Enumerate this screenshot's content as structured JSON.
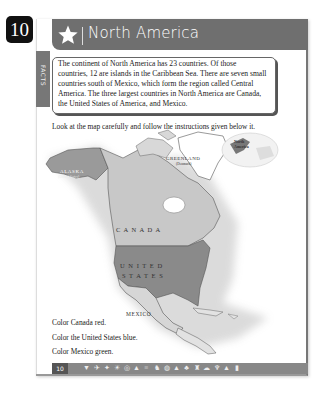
{
  "page_number_badge": "10",
  "header": {
    "title": "North America",
    "icon": "star-icon"
  },
  "facts": {
    "tab_label": "FACTS",
    "text": "The continent of North America has 23 countries. Of those countries, 12 are islands in the Caribbean Sea. There are seven small countries south of Mexico, which form the region called Central America. The three largest countries in North America are Canada, the United States of America, and Mexico."
  },
  "instructions": "Look at the map carefully and follow the instructions given below it.",
  "map": {
    "labels": {
      "alaska": "ALASKA",
      "alaska_sub": "(United States)",
      "greenland": "GREENLAND",
      "greenland_sub": "(Denmark)",
      "canada": "C A N A D A",
      "united": "U N I T E D",
      "states": "S T A T E S",
      "mexico": "MEXICO",
      "inset": "North America"
    },
    "colors": {
      "canada": "#c8c8c8",
      "usa": "#8a8a8a",
      "alaska": "#9a9a9a",
      "mexico": "#d6d6d6",
      "greenland": "#ffffff",
      "land_other": "#e2e2e2"
    }
  },
  "tasks": [
    "Color Canada red.",
    "Color the United States blue.",
    "Color Mexico green."
  ],
  "footer": {
    "page_number": "10",
    "icons": [
      "▼",
      "✈",
      "✦",
      "☀",
      "◎",
      "▲",
      "≡",
      "♞",
      "◍",
      "▲",
      "♣",
      "♜",
      "☁",
      "♆",
      "▲",
      "▮"
    ]
  }
}
